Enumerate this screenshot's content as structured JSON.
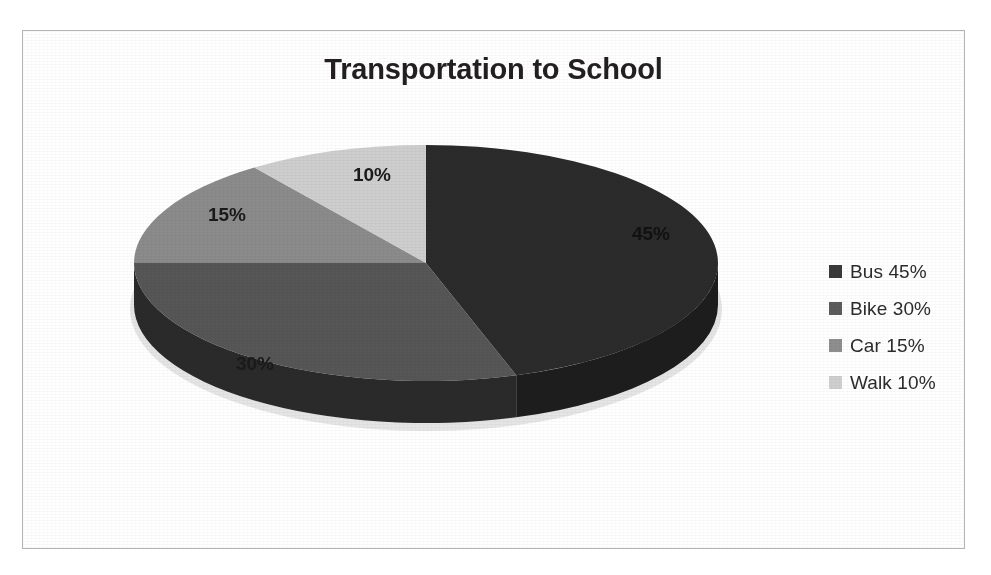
{
  "scan_artifact_text": "",
  "chart_title": "Transportation to School",
  "labels": {
    "bus": "45%",
    "bike": "30%",
    "car": "15%",
    "walk": "10%"
  },
  "legend": {
    "items": [
      {
        "label": "Bus 45%",
        "color": "#3a3a3a",
        "marker": "square-swatch"
      },
      {
        "label": "Bike 30%",
        "color": "#5c5c5c",
        "marker": "square-swatch"
      },
      {
        "label": "Car 15%",
        "color": "#8e8e8e",
        "marker": "square-swatch"
      },
      {
        "label": "Walk 10%",
        "color": "#cfcfcf",
        "marker": "square-swatch"
      }
    ]
  },
  "chart_data": {
    "type": "pie",
    "title": "Transportation to School",
    "subtitle": "",
    "xlabel": "",
    "ylabel": "",
    "three_d": true,
    "grid": false,
    "legend_position": "right",
    "start_angle_deg": 0,
    "direction": "clockwise",
    "total": 100,
    "unit": "%",
    "categories": [
      "Bus",
      "Bike",
      "Car",
      "Walk"
    ],
    "values": [
      45,
      30,
      15,
      10
    ],
    "slices": [
      {
        "name": "Bus",
        "value": 45,
        "label": "45%",
        "color": "#2b2b2b",
        "side_color": "#1d1d1d",
        "start_deg": 0,
        "end_deg": 162
      },
      {
        "name": "Bike",
        "value": 30,
        "label": "30%",
        "color": "#565656",
        "side_color": "#2a2a2a",
        "start_deg": 162,
        "end_deg": 270
      },
      {
        "name": "Car",
        "value": 15,
        "label": "15%",
        "color": "#8b8b8b",
        "side_color": "#4a4a4a",
        "start_deg": 270,
        "end_deg": 324
      },
      {
        "name": "Walk",
        "value": 10,
        "label": "10%",
        "color": "#cecece",
        "side_color": "#6e6e6e",
        "start_deg": 324,
        "end_deg": 360
      }
    ]
  }
}
